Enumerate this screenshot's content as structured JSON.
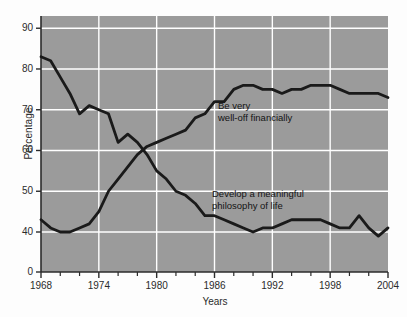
{
  "chart_data": {
    "type": "line",
    "title": "",
    "xlabel": "Years",
    "ylabel": "Percentage",
    "xlim": [
      1968,
      2004
    ],
    "ylim": [
      38,
      93
    ],
    "grid": true,
    "legend_position": "inline-annotation",
    "y_axis_broken": true,
    "y_break_from": 0,
    "y_break_to": 38,
    "ytick_labels": [
      "0",
      "40",
      "50",
      "60",
      "70",
      "80",
      "90"
    ],
    "ytick_values": [
      0,
      40,
      50,
      60,
      70,
      80,
      90
    ],
    "xtick_labels": [
      "1968",
      "1974",
      "1980",
      "1986",
      "1992",
      "1998",
      "2004"
    ],
    "xtick_values": [
      1968,
      1974,
      1980,
      1986,
      1992,
      1998,
      2004
    ],
    "xtick_minor_values": [
      1970,
      1972,
      1976,
      1978,
      1982,
      1984,
      1988,
      1990,
      1994,
      1996,
      2000,
      2002
    ],
    "plot_bg_color": "#9b9b9b",
    "grid_color": "#ffffff",
    "line_color": "#1a1a1a",
    "x": [
      1968,
      1969,
      1970,
      1971,
      1972,
      1973,
      1974,
      1975,
      1976,
      1977,
      1978,
      1979,
      1980,
      1981,
      1982,
      1983,
      1984,
      1985,
      1986,
      1987,
      1988,
      1989,
      1990,
      1991,
      1992,
      1993,
      1994,
      1995,
      1996,
      1997,
      1998,
      1999,
      2000,
      2001,
      2002,
      2003,
      2004
    ],
    "series": [
      {
        "name": "Develop a meaningful philosophy of life",
        "annotation": "Develop a meaningful\nphilosophy of life",
        "values": [
          83,
          82,
          78,
          74,
          69,
          71,
          70,
          69,
          62,
          64,
          62,
          59,
          55,
          53,
          50,
          49,
          47,
          44,
          44,
          43,
          42,
          41,
          40,
          41,
          41,
          42,
          43,
          43,
          43,
          43,
          42,
          41,
          41,
          44,
          41,
          39,
          41
        ]
      },
      {
        "name": "Be very well-off financially",
        "annotation": "Be very\nwell-off financially",
        "values": [
          43,
          41,
          40,
          40,
          41,
          42,
          45,
          50,
          53,
          56,
          59,
          61,
          62,
          63,
          64,
          65,
          68,
          69,
          72,
          72,
          75,
          76,
          76,
          75,
          75,
          74,
          75,
          75,
          76,
          76,
          76,
          75,
          74,
          74,
          74,
          74,
          73
        ]
      }
    ]
  },
  "annotations": {
    "upper": {
      "line1": "Be very",
      "line2": "well-off financially"
    },
    "lower": {
      "line1": "Develop a meaningful",
      "line2": "philosophy of life"
    }
  },
  "axes": {
    "y_title": "Percentage",
    "x_title": "Years"
  }
}
